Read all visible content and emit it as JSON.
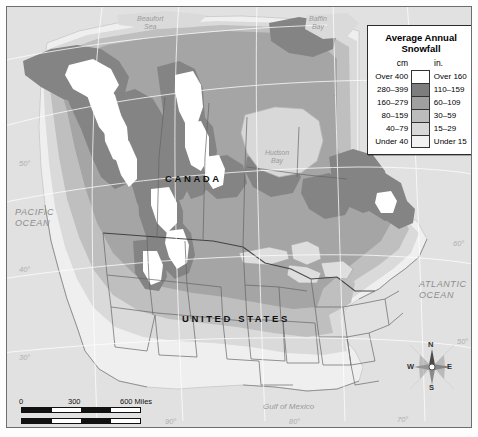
{
  "legend": {
    "title": "Average Annual\nSnowfall",
    "title_line1": "Average Annual",
    "title_line2": "Snowfall",
    "unit_left": "cm",
    "unit_right": "in.",
    "rows": [
      {
        "cm": "Over 400",
        "in": "Over 160",
        "color": "#ffffff"
      },
      {
        "cm": "280–399",
        "in": "110–159",
        "color": "#7d7d7d"
      },
      {
        "cm": "160–279",
        "in": "60–109",
        "color": "#a0a0a0"
      },
      {
        "cm": "80–159",
        "in": "30–59",
        "color": "#bcbcbc"
      },
      {
        "cm": "40–79",
        "in": "15–29",
        "color": "#d8d8d8"
      },
      {
        "cm": "Under 40",
        "in": "Under 15",
        "color": "#f2f2f2"
      }
    ]
  },
  "map": {
    "countries": [
      {
        "name": "CANADA",
        "label": "C A N A D A"
      },
      {
        "name": "UNITED STATES",
        "label": "U N I T E D   S T A T E S"
      }
    ],
    "country_canada": "CANADA",
    "country_usa": "UNITED STATES",
    "oceans": [
      {
        "line1": "PACIFIC",
        "line2": "OCEAN"
      },
      {
        "line1": "ATLANTIC",
        "line2": "OCEAN"
      }
    ],
    "pacific_line1": "PACIFIC",
    "pacific_line2": "OCEAN",
    "atlantic_line1": "ATLANTIC",
    "atlantic_line2": "OCEAN",
    "water_bodies": [
      {
        "line1": "Beaufort",
        "line2": "Sea"
      },
      {
        "line1": "Baffin",
        "line2": "Bay"
      },
      {
        "line1": "Hudson",
        "line2": "Bay"
      },
      {
        "line1": "Gulf of Mexico",
        "line2": ""
      }
    ],
    "beaufort_line1": "Beaufort",
    "beaufort_line2": "Sea",
    "baffin_line1": "Baffin",
    "baffin_line2": "Bay",
    "hudson_line1": "Hudson",
    "hudson_line2": "Bay",
    "gulf": "Gulf of Mexico",
    "graticule": {
      "latitudes": [
        "50°",
        "40°",
        "30°"
      ],
      "longitudes": [
        "90°",
        "80°",
        "70°"
      ],
      "lat_50": "50°",
      "lat_40": "40°",
      "lat_30": "30°",
      "lat_r_60": "60°",
      "lat_r_50": "50°",
      "lon_90": "90°",
      "lon_80": "80°",
      "lon_70": "70°"
    }
  },
  "scale": {
    "miles_unit": "600 Miles",
    "km_unit": "600 Kilometers",
    "miles_ticks": [
      "0",
      "300",
      "600 Miles"
    ],
    "km_ticks": [
      "0",
      "300",
      "600 Kilometers"
    ],
    "m0": "0",
    "m3": "300",
    "m6": "600 Miles",
    "k0": "0",
    "k3": "300",
    "k6": "600 Kilometers"
  },
  "compass": {
    "n": "N",
    "e": "E",
    "s": "S",
    "w": "W"
  },
  "colors": {
    "over400": "#ffffff",
    "cm280_399": "#7d7d7d",
    "cm160_279": "#a0a0a0",
    "cm80_159": "#bcbcbc",
    "cm40_79": "#d8d8d8",
    "under40": "#f2f2f2",
    "water": "#dcdcdc",
    "frame": "#6e6e6e"
  },
  "chart_data": {
    "type": "map",
    "title": "Average Annual Snowfall",
    "regions": "North America (Canada and United States)",
    "classes": [
      {
        "cm": "Over 400",
        "inches": "Over 160",
        "shade": "#ffffff"
      },
      {
        "cm": "280-399",
        "inches": "110-159",
        "shade": "#7d7d7d"
      },
      {
        "cm": "160-279",
        "inches": "60-109",
        "shade": "#a0a0a0"
      },
      {
        "cm": "80-159",
        "inches": "30-59",
        "shade": "#bcbcbc"
      },
      {
        "cm": "40-79",
        "inches": "15-29",
        "shade": "#d8d8d8"
      },
      {
        "cm": "Under 40",
        "inches": "Under 15",
        "shade": "#f2f2f2"
      }
    ]
  }
}
